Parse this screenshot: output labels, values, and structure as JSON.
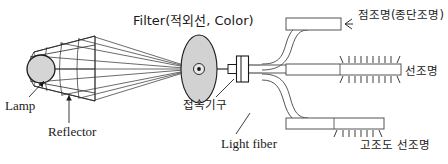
{
  "diagram": {
    "title_text": "Fiber optic illumination system schematic",
    "background_color": "#ffffff",
    "stroke_color": "#1a1a1a",
    "fill_light_gray": "#d9d9d9",
    "fill_mid_gray": "#c4c4c4",
    "labels": {
      "filter": "Filter(적외선, Color)",
      "lamp": "Lamp",
      "reflector": "Reflector",
      "connector": "접속기구",
      "light_fiber": "Light fiber",
      "point_light": "점조명(종단조명)",
      "line_light": "선조명",
      "high_intensity_line_light": "고조도 선조명"
    },
    "components": [
      {
        "name": "lamp-bulb",
        "shape": "circle",
        "note": "gray filled light source"
      },
      {
        "name": "reflector-cone",
        "shape": "cone",
        "note": "faceted parabolic reflector with grid facets"
      },
      {
        "name": "light-rays",
        "shape": "lines",
        "note": "converging rays from reflector to filter focus"
      },
      {
        "name": "filter-disk",
        "shape": "ellipse",
        "note": "gray tinted filter disc with central aperture"
      },
      {
        "name": "connector-block",
        "shape": "rect",
        "note": "coupling fixture between filter and fiber"
      },
      {
        "name": "fiber-bundle",
        "shape": "path",
        "note": "bundle curving into three branches"
      },
      {
        "name": "branch-point",
        "shape": "rect",
        "note": "top branch, terminal/point illumination"
      },
      {
        "name": "branch-line",
        "shape": "rect",
        "note": "middle branch, line illumination emitting both sides"
      },
      {
        "name": "branch-high",
        "shape": "rect",
        "note": "bottom branch, high-intensity line illumination"
      }
    ]
  }
}
